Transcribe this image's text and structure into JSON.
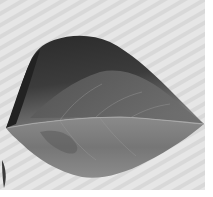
{
  "image": {
    "subject": "leaf",
    "style": "grayscale photograph",
    "background": "light gray diagonal stripes"
  },
  "colors": {
    "background_light": "#e4e4e4",
    "background_stripe": "#d6d6d6",
    "leaf_dark": "#2e2e2e",
    "leaf_mid": "#6e6e6e",
    "leaf_light": "#8e8e8e",
    "vein": "#b0b0b0"
  }
}
